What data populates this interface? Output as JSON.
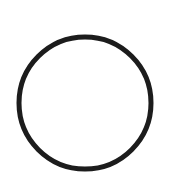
{
  "canvas": {
    "width": 170,
    "height": 189,
    "background": "#ffffff"
  },
  "shape": {
    "type": "circle",
    "name": "circle-outline",
    "cx": 85,
    "cy": 103,
    "r": 66,
    "stroke": "#1c1c1c",
    "stroke_width": 5,
    "fill": "none"
  }
}
